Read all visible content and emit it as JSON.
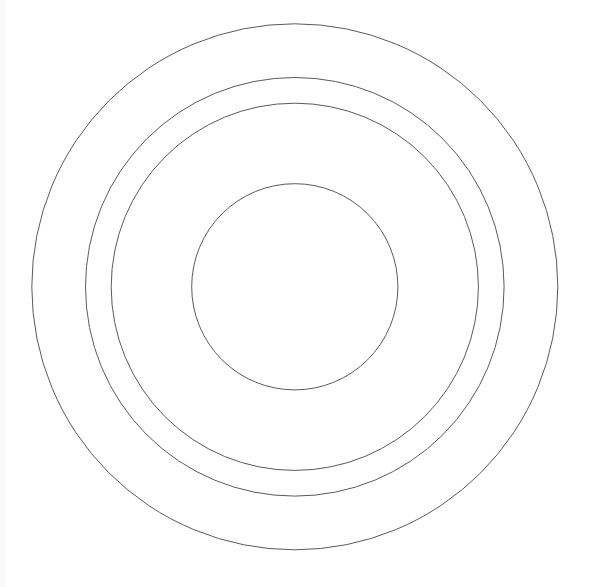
{
  "diagram": {
    "type": "concentric-circles",
    "circle_count": 4,
    "labels": [],
    "stroke_color": "#5a5a5a",
    "fill_color": "none",
    "background_color": "#ffffff",
    "rings": [
      {
        "name": "outer-ring",
        "relative_radius": 1.0
      },
      {
        "name": "second-ring",
        "relative_radius": 0.796
      },
      {
        "name": "third-ring",
        "relative_radius": 0.698
      },
      {
        "name": "inner-circle",
        "relative_radius": 0.392
      }
    ]
  }
}
